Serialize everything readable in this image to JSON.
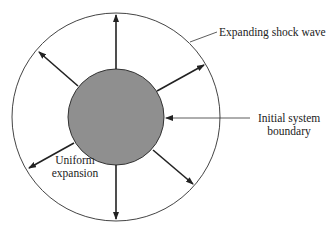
{
  "diagram": {
    "labels": {
      "shock_wave": "Expanding shock wave",
      "initial_boundary_line1": "Initial system",
      "initial_boundary_line2": "boundary",
      "expansion_line1": "Uniform",
      "expansion_line2": "expansion"
    },
    "colors": {
      "inner_fill": "#8f8f8f",
      "stroke": "#222222"
    },
    "arrow_directions_deg": [
      90,
      30,
      -30,
      -60,
      -90,
      -150,
      150,
      130
    ]
  }
}
